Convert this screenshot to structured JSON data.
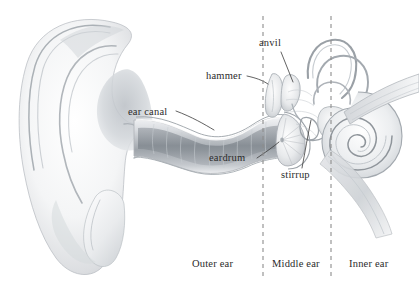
{
  "figure": {
    "background_color": "#ffffff",
    "ink_color": "#2b2b2b",
    "shading_color": "#9aa0a6",
    "width": 419,
    "height": 290
  },
  "labels": {
    "anvil": "anvil",
    "hammer": "hammer",
    "ear_canal": "ear canal",
    "eardrum": "eardrum",
    "stirrup": "stirrup"
  },
  "regions": {
    "outer": "Outer ear",
    "middle": "Middle ear",
    "inner": "Inner ear"
  },
  "dividers": {
    "count": 2,
    "style": "dashed",
    "color": "#8d8d8d",
    "x_positions": [
      263,
      331
    ],
    "y_start": 16,
    "y_end": 276
  },
  "structures": [
    {
      "name": "pinna",
      "description": "outer ear flap with helix, antihelix, concha and lobe"
    },
    {
      "name": "ear-canal",
      "description": "S-curved auditory canal leading from concha to eardrum"
    },
    {
      "name": "eardrum",
      "description": "tympanic membrane at inner end of ear canal"
    },
    {
      "name": "hammer",
      "description": "malleus ossicle"
    },
    {
      "name": "anvil",
      "description": "incus ossicle"
    },
    {
      "name": "stirrup",
      "description": "stapes ossicle at oval window"
    },
    {
      "name": "semicircular-canals",
      "description": "three looping balance canals"
    },
    {
      "name": "cochlea",
      "description": "spiral hearing organ"
    },
    {
      "name": "eustachian-tube",
      "description": "tapering tube descending to the right"
    },
    {
      "name": "auditory-nerve",
      "description": "nerve bundle extending to the upper right"
    }
  ]
}
